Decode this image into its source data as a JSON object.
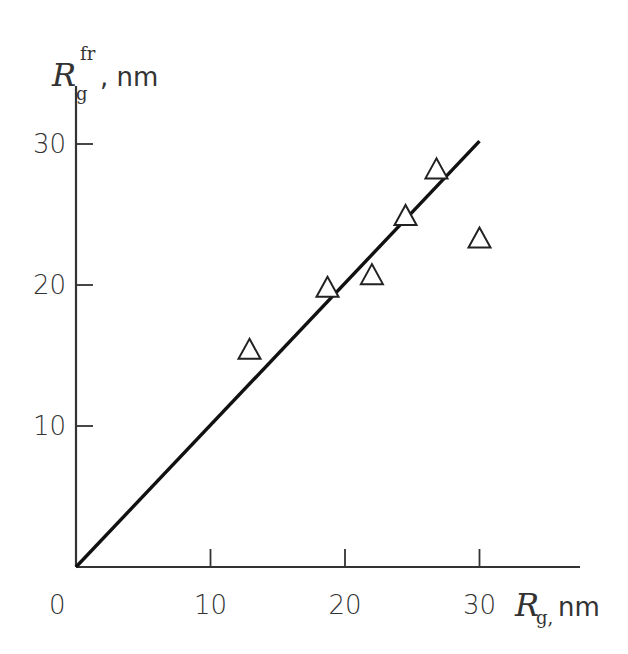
{
  "chart_data": {
    "type": "scatter",
    "title": "",
    "xlabel": "R_g, nm",
    "ylabel": "R_g^fr, nm",
    "x_axis": {
      "label_main": "R",
      "label_sub": "g,",
      "label_unit": "nm",
      "ticks": [
        10,
        20,
        30
      ],
      "origin_label": "0",
      "range": [
        0,
        37
      ]
    },
    "y_axis": {
      "label_main": "R",
      "label_sub": "g",
      "label_sup": "fr",
      "label_unit": ", nm",
      "ticks": [
        10,
        20,
        30
      ],
      "range": [
        0,
        35
      ]
    },
    "grid": false,
    "legend": null,
    "series": [
      {
        "name": "data",
        "marker": "open-triangle",
        "points": [
          {
            "x": 12.9,
            "y": 15.4
          },
          {
            "x": 18.7,
            "y": 19.8
          },
          {
            "x": 22.0,
            "y": 20.7
          },
          {
            "x": 24.5,
            "y": 24.9
          },
          {
            "x": 26.8,
            "y": 28.2
          },
          {
            "x": 30.0,
            "y": 23.3
          }
        ]
      },
      {
        "name": "fit",
        "type": "line",
        "points": [
          {
            "x": 0,
            "y": 0
          },
          {
            "x": 30,
            "y": 30.2
          }
        ]
      }
    ]
  },
  "colors": {
    "axis": "#333333",
    "line": "#111111",
    "marker_stroke": "#222222",
    "marker_fill": "#ffffff"
  }
}
